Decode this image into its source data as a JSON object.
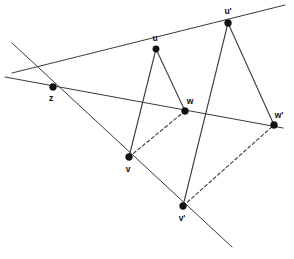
{
  "figure": {
    "kind": "geometry-diagram",
    "width": 294,
    "height": 259,
    "background_color": "#ffffff",
    "line_color": "#3a3a3a",
    "point_color": "#111111",
    "points": [
      {
        "id": "z",
        "label": "z",
        "x": 53,
        "y": 87,
        "label_x": 51,
        "label_y": 101,
        "r": 3.4
      },
      {
        "id": "u",
        "label": "u",
        "x": 156,
        "y": 49,
        "label_x": 155,
        "label_y": 41,
        "r": 3.2
      },
      {
        "id": "uP",
        "label": "u'",
        "x": 228,
        "y": 23,
        "label_x": 228,
        "label_y": 14,
        "r": 3.4
      },
      {
        "id": "w",
        "label": "w",
        "x": 185,
        "y": 111,
        "label_x": 190,
        "label_y": 104,
        "r": 3.4
      },
      {
        "id": "wP",
        "label": "w'",
        "x": 274,
        "y": 125,
        "label_x": 279,
        "label_y": 118,
        "r": 3.4
      },
      {
        "id": "v",
        "label": "v",
        "x": 129,
        "y": 157,
        "label_x": 128,
        "label_y": 172,
        "r": 3.4
      },
      {
        "id": "vP",
        "label": "v'",
        "x": 183,
        "y": 206,
        "label_x": 182,
        "label_y": 221,
        "r": 3.4
      }
    ],
    "rays": [
      {
        "id": "ray-z-u-uprime",
        "name": "line through z, u and u-prime",
        "x1": 12,
        "y1": 73,
        "x2": 285,
        "y2": 5
      },
      {
        "id": "ray-z-w-wprime",
        "name": "line through z, w and w-prime",
        "x1": 5,
        "y1": 77,
        "x2": 283,
        "y2": 128
      },
      {
        "id": "ray-z-v-vprime",
        "name": "line through z, v and v-prime",
        "x1": 12,
        "y1": 43,
        "x2": 232,
        "y2": 247
      }
    ],
    "edges": [
      {
        "id": "edge-u-v",
        "name": "triangle-side-u-v",
        "from": "u",
        "to": "v",
        "style": "solid"
      },
      {
        "id": "edge-u-w",
        "name": "triangle-side-u-w",
        "from": "u",
        "to": "w",
        "style": "solid"
      },
      {
        "id": "edge-v-w",
        "name": "triangle-side-v-w",
        "from": "v",
        "to": "w",
        "style": "dashed"
      },
      {
        "id": "edge-up-vp",
        "name": "triangle-side-uprime-vprime",
        "from": "uP",
        "to": "vP",
        "style": "solid"
      },
      {
        "id": "edge-up-wp",
        "name": "triangle-side-uprime-wprime",
        "from": "uP",
        "to": "wP",
        "style": "solid"
      },
      {
        "id": "edge-vp-wp",
        "name": "triangle-side-vprime-wprime",
        "from": "vP",
        "to": "wP",
        "style": "dashed"
      }
    ]
  }
}
